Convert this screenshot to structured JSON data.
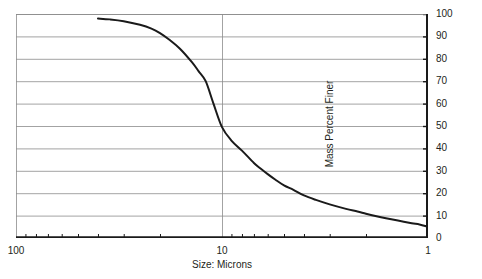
{
  "chart_data": {
    "type": "line",
    "title": "",
    "subtitle": "",
    "xlabel": "Size: Microns",
    "ylabel": "Mass Percent Finer",
    "x_scale": "log",
    "x_reversed": true,
    "xlim": [
      100,
      1
    ],
    "ylim": [
      0,
      100
    ],
    "grid": "horizontal-major-and-one-vertical-at-10",
    "legend": "none",
    "x_major_ticks": [
      100,
      10,
      1
    ],
    "x_major_tick_labels": [
      "100",
      "10",
      "1"
    ],
    "x_minor_ticks": [
      90,
      80,
      70,
      60,
      50,
      40,
      30,
      20,
      9,
      8,
      7,
      6,
      5,
      4,
      3,
      2
    ],
    "y_ticks": [
      0,
      10,
      20,
      30,
      40,
      50,
      60,
      70,
      80,
      90,
      100
    ],
    "y_tick_labels": [
      "0",
      "10",
      "20",
      "30",
      "40",
      "50",
      "60",
      "70",
      "80",
      "90",
      "100"
    ],
    "series": [
      {
        "name": "Particle size distribution",
        "color": "#1a1a1a",
        "line_width": 2,
        "x": [
          40,
          35,
          30,
          25,
          22,
          20,
          18,
          16,
          14,
          13,
          12,
          11,
          10,
          9,
          8,
          7,
          6.5,
          6,
          5.5,
          5,
          4.5,
          4,
          3.5,
          3,
          2.5,
          2.2,
          2,
          1.8,
          1.6,
          1.4,
          1.2,
          1.1,
          1
        ],
        "y": [
          98,
          97.6,
          96.8,
          95.2,
          93.5,
          91.5,
          88.5,
          84.5,
          78.5,
          74.5,
          70,
          60,
          49.5,
          43.5,
          39,
          33.5,
          31,
          28.5,
          26,
          23.5,
          21.5,
          19,
          17,
          15,
          13,
          11.8,
          10.8,
          9.8,
          8.8,
          7.8,
          6.6,
          6,
          5
        ]
      }
    ],
    "annotations": []
  },
  "axes": {
    "x_title": "Size: Microns",
    "y_title": "Mass Percent Finer",
    "x_labels": [
      {
        "text": "100",
        "value": 100
      },
      {
        "text": "10",
        "value": 10
      },
      {
        "text": "1",
        "value": 1
      }
    ],
    "y_labels": [
      {
        "text": "100",
        "value": 100
      },
      {
        "text": "90",
        "value": 90
      },
      {
        "text": "80",
        "value": 80
      },
      {
        "text": "70",
        "value": 70
      },
      {
        "text": "60",
        "value": 60
      },
      {
        "text": "50",
        "value": 50
      },
      {
        "text": "40",
        "value": 40
      },
      {
        "text": "30",
        "value": 30
      },
      {
        "text": "20",
        "value": 20
      },
      {
        "text": "10",
        "value": 10
      },
      {
        "text": "0",
        "value": 0
      }
    ]
  },
  "colors": {
    "background": "#ffffff",
    "gridline": "#8c8c8c",
    "axis": "#1a1a1a",
    "curve": "#1a1a1a",
    "text": "#231f20"
  }
}
